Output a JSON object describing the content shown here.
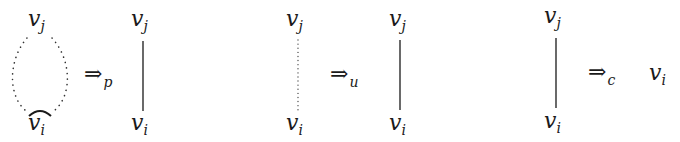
{
  "diagram": {
    "panels": [
      {
        "id": "p",
        "before": {
          "top": "v",
          "top_sub": "j",
          "bottom": "v",
          "bottom_sub": "i",
          "edge": "dotted-loop",
          "bottom_mark": "arc"
        },
        "arrow": {
          "symbol": "⇒",
          "sub": "p"
        },
        "after": {
          "top": "v",
          "top_sub": "j",
          "bottom": "v",
          "bottom_sub": "i",
          "edge": "solid"
        }
      },
      {
        "id": "u",
        "before": {
          "top": "v",
          "top_sub": "j",
          "bottom": "v",
          "bottom_sub": "i",
          "edge": "dotted"
        },
        "arrow": {
          "symbol": "⇒",
          "sub": "u"
        },
        "after": {
          "top": "v",
          "top_sub": "j",
          "bottom": "v",
          "bottom_sub": "i",
          "edge": "solid"
        }
      },
      {
        "id": "c",
        "before": {
          "top": "v",
          "top_sub": "j",
          "bottom": "v",
          "bottom_sub": "i",
          "edge": "solid"
        },
        "arrow": {
          "symbol": "⇒",
          "sub": "c"
        },
        "after": {
          "node": "v",
          "node_sub": "i"
        }
      }
    ],
    "colors": {
      "ink": "#1a1a1a",
      "background": "#ffffff"
    }
  }
}
